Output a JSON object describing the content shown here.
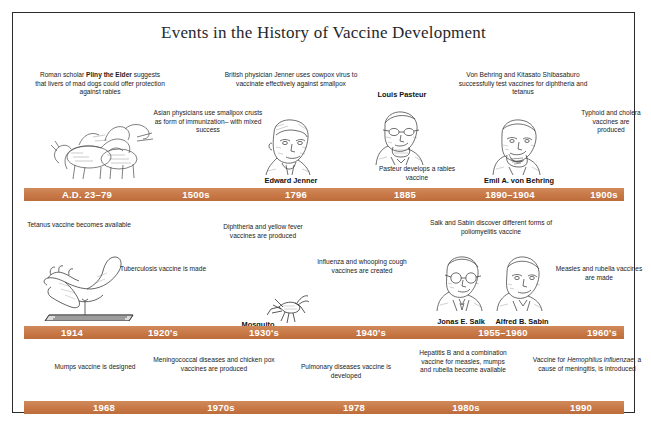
{
  "poster": {
    "title": "Events in the History of Vaccine Development",
    "accent_color": "#c87845",
    "bar_text_color": "#ffffff",
    "background_color": "#ffffff",
    "border_color": "#2b2b2b"
  },
  "rows": [
    {
      "id": "row-1",
      "bar_labels": [
        "A.D. 23–79",
        "1500s",
        "1796",
        "1885",
        "1890–1904",
        "1900s"
      ],
      "captions": [
        "Roman scholar Pliny the Elder suggests that livers of mad dogs could offer protection against rabies",
        "Asian physicians use smallpox crusts as form of immunization– with mixed success",
        "British physician Jenner uses cowpox virus to vaccinate effectively against smallpox",
        "Louis Pasteur",
        "Pasteur develops a rabies vaccine",
        "Von Behring and Kitasato Shibasaburo successfully test vaccines for diphtheria and tetanus",
        "Typhoid and cholera vaccines are produced"
      ],
      "portrait_names": [
        "Edward Jenner",
        "Emil A. von Behring"
      ]
    },
    {
      "id": "row-2",
      "bar_labels": [
        "1914",
        "1920's",
        "1930's",
        "1940's",
        "1955–1960",
        "1960's"
      ],
      "captions": [
        "Tetanus vaccine becomes available",
        "Tuberculosis vaccine is made",
        "Diphtheria and yellow fever vaccines are produced",
        "Influenza and whooping cough vaccines are created",
        "Salk and Sabin discover different forms of poliomyelitis vaccine",
        "Measles and rubella vaccines are made"
      ],
      "portrait_names": [
        "Mosquito",
        "Jonas E. Salk",
        "Alfred B. Sabin"
      ]
    },
    {
      "id": "row-3",
      "bar_labels": [
        "1968",
        "1970s",
        "1978",
        "1980s",
        "1990"
      ],
      "captions": [
        "Mumps vaccine is designed",
        "Meningococcal diseases and chicken pox vaccines are produced",
        "Pulmonary diseases vaccine is developed",
        "Hepatitis B and a combination vaccine for measles, mumps and rubella become available",
        "Vaccine for Hemophilus influenzae, a cause of meningitis, is introduced"
      ]
    }
  ],
  "captions_rich": {
    "pliny": {
      "pre": "Roman scholar ",
      "bold": "Pliny the Elder",
      "post": " suggests that livers of mad dogs could offer protection against rabies"
    },
    "hemophilus": {
      "pre": "Vaccine for ",
      "italic": "Hemophilus influenzae",
      "post": ", a cause of meningitis, is introduced"
    }
  },
  "illustrations": [
    {
      "name": "rabid-dogs-engraving",
      "row": 1
    },
    {
      "name": "edward-jenner-portrait",
      "row": 1
    },
    {
      "name": "louis-pasteur-portrait",
      "row": 1
    },
    {
      "name": "emil-von-behring-portrait",
      "row": 1
    },
    {
      "name": "foot-and-nail-engraving",
      "row": 2
    },
    {
      "name": "mosquito-engraving",
      "row": 2
    },
    {
      "name": "jonas-salk-portrait",
      "row": 2
    },
    {
      "name": "alfred-sabin-portrait",
      "row": 2
    }
  ]
}
